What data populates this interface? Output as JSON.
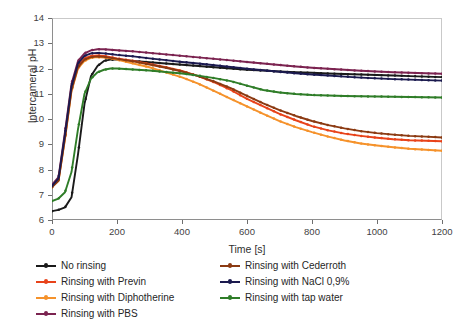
{
  "chart_data": {
    "type": "line",
    "title": "",
    "xlabel": "Time [s]",
    "ylabel": "Intercameral pH",
    "xlim": [
      0,
      1200
    ],
    "ylim": [
      6,
      14
    ],
    "xticks": [
      0,
      200,
      400,
      600,
      800,
      1000,
      1200
    ],
    "yticks": [
      6,
      7,
      8,
      9,
      10,
      11,
      12,
      13,
      14
    ],
    "grid": false,
    "legend_position": "below",
    "marker": "filled-circle",
    "x": [
      0,
      20,
      40,
      60,
      80,
      100,
      120,
      140,
      160,
      180,
      200,
      250,
      300,
      350,
      400,
      450,
      500,
      550,
      600,
      650,
      700,
      750,
      800,
      850,
      900,
      950,
      1000,
      1050,
      1100,
      1150,
      1200
    ],
    "series": [
      {
        "name": "No rinsing",
        "color": "#1a1a1a",
        "values": [
          6.35,
          6.4,
          6.5,
          6.9,
          8.6,
          10.6,
          11.7,
          12.1,
          12.3,
          12.35,
          12.35,
          12.3,
          12.25,
          12.2,
          12.15,
          12.1,
          12.05,
          12.0,
          11.95,
          11.92,
          11.88,
          11.85,
          11.83,
          11.8,
          11.78,
          11.76,
          11.74,
          11.72,
          11.7,
          11.68,
          11.66
        ]
      },
      {
        "name": "Rinsing with Previn",
        "color": "#e8431a",
        "values": [
          7.35,
          7.6,
          9.3,
          11.2,
          12.1,
          12.4,
          12.5,
          12.52,
          12.5,
          12.45,
          12.4,
          12.3,
          12.18,
          12.05,
          11.9,
          11.7,
          11.45,
          11.15,
          10.8,
          10.5,
          10.2,
          9.95,
          9.72,
          9.55,
          9.42,
          9.33,
          9.26,
          9.2,
          9.16,
          9.14,
          9.12
        ]
      },
      {
        "name": "Rinsing with Diphotherine",
        "color": "#f5922b",
        "values": [
          7.3,
          7.55,
          9.2,
          11.1,
          12.0,
          12.3,
          12.42,
          12.45,
          12.43,
          12.4,
          12.35,
          12.2,
          12.05,
          11.85,
          11.65,
          11.4,
          11.1,
          10.8,
          10.5,
          10.2,
          9.92,
          9.68,
          9.48,
          9.3,
          9.15,
          9.03,
          8.95,
          8.88,
          8.82,
          8.78,
          8.74
        ]
      },
      {
        "name": "Rinsing with PBS",
        "color": "#7b2350",
        "values": [
          7.4,
          7.7,
          9.5,
          11.4,
          12.3,
          12.6,
          12.72,
          12.76,
          12.76,
          12.74,
          12.72,
          12.68,
          12.62,
          12.56,
          12.5,
          12.44,
          12.38,
          12.32,
          12.26,
          12.2,
          12.14,
          12.08,
          12.03,
          11.99,
          11.95,
          11.91,
          11.88,
          11.85,
          11.83,
          11.81,
          11.79
        ]
      },
      {
        "name": "Rinsing with Cederroth",
        "color": "#8b3a12",
        "values": [
          7.3,
          7.55,
          9.25,
          11.15,
          12.05,
          12.35,
          12.45,
          12.48,
          12.46,
          12.42,
          12.38,
          12.28,
          12.16,
          12.03,
          11.88,
          11.7,
          11.48,
          11.22,
          10.92,
          10.62,
          10.35,
          10.12,
          9.92,
          9.76,
          9.63,
          9.52,
          9.44,
          9.38,
          9.33,
          9.3,
          9.27
        ]
      },
      {
        "name": "Rinsing with NaCl 0,9%",
        "color": "#1b1a4f",
        "values": [
          7.35,
          7.65,
          9.4,
          11.3,
          12.2,
          12.5,
          12.6,
          12.62,
          12.6,
          12.57,
          12.54,
          12.48,
          12.4,
          12.33,
          12.26,
          12.2,
          12.13,
          12.06,
          11.99,
          11.93,
          11.87,
          11.81,
          11.76,
          11.72,
          11.68,
          11.64,
          11.61,
          11.58,
          11.56,
          11.54,
          11.52
        ]
      },
      {
        "name": "Rinsing with tap water",
        "color": "#2f7d28",
        "values": [
          6.75,
          6.85,
          7.1,
          7.9,
          9.6,
          11.0,
          11.6,
          11.85,
          11.95,
          12.0,
          12.0,
          11.96,
          11.92,
          11.86,
          11.8,
          11.72,
          11.62,
          11.5,
          11.32,
          11.15,
          11.05,
          10.99,
          10.95,
          10.93,
          10.91,
          10.9,
          10.89,
          10.88,
          10.87,
          10.86,
          10.85
        ]
      }
    ]
  },
  "axes": {
    "ylabel_text": "Intercameral pH",
    "xlabel_text": "Time [s]",
    "ytick_labels": [
      "14",
      "13",
      "12",
      "11",
      "10",
      "9",
      "8",
      "7",
      "6"
    ],
    "xtick_labels": [
      "0",
      "200",
      "400",
      "600",
      "800",
      "1000",
      "1200"
    ]
  },
  "legend": {
    "left_column": [
      {
        "label": "No rinsing",
        "color": "#1a1a1a"
      },
      {
        "label": "Rinsing with Previn",
        "color": "#e8431a"
      },
      {
        "label": "Rinsing with Diphotherine",
        "color": "#f5922b"
      },
      {
        "label": "Rinsing with PBS",
        "color": "#7b2350"
      }
    ],
    "right_column": [
      {
        "label": "Rinsing with Cederroth",
        "color": "#8b3a12"
      },
      {
        "label": "Rinsing with NaCl 0,9%",
        "color": "#1b1a4f"
      },
      {
        "label": "Rinsing with tap water",
        "color": "#2f7d28"
      }
    ]
  }
}
